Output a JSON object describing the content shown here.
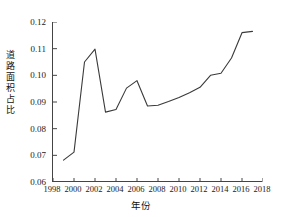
{
  "chart_data": {
    "type": "line",
    "title": "",
    "xlabel": "年份",
    "ylabel": "道路面积占比",
    "xlim": [
      1998,
      2018
    ],
    "ylim": [
      0.06,
      0.12
    ],
    "grid": false,
    "legend": null,
    "x_ticks": [
      "1998",
      "2000",
      "2002",
      "2004",
      "2006",
      "2008",
      "2010",
      "2012",
      "2014",
      "2016",
      "2018"
    ],
    "y_ticks": [
      "0.06",
      "0.07",
      "0.08",
      "0.09",
      "0.10",
      "0.11",
      "0.12"
    ],
    "series": [
      {
        "name": "道路面积占比",
        "color": "#3a3a3a",
        "x": [
          1999,
          2000,
          2001,
          2002,
          2003,
          2004,
          2005,
          2006,
          2007,
          2008,
          2009,
          2010,
          2011,
          2012,
          2013,
          2014,
          2015,
          2016,
          2017
        ],
        "values": [
          0.0682,
          0.0712,
          0.105,
          0.1098,
          0.0862,
          0.0872,
          0.0952,
          0.098,
          0.0885,
          0.0888,
          0.0902,
          0.0917,
          0.0935,
          0.0955,
          0.1,
          0.1008,
          0.1065,
          0.116,
          0.1165
        ]
      }
    ]
  }
}
